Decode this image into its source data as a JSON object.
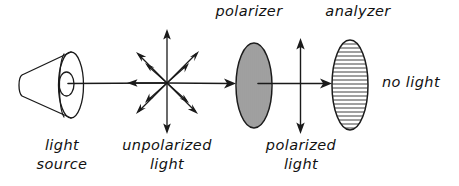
{
  "diagram": {
    "title_hidden": "",
    "background_color": "#ffffff",
    "ink_color": "#1a1a1a",
    "labels": {
      "polarizer": "polarizer",
      "analyzer": "analyzer",
      "light_source_line1": "light",
      "light_source_line2": "source",
      "unpolarized_line1": "unpolarized",
      "unpolarized_line2": "light",
      "polarized_line1": "polarized",
      "polarized_line2": "light",
      "no_light": "no light"
    },
    "elements": {
      "light_source_icon": "cone-lamp-icon",
      "unpolarized_star_icon": "radiating-arrows-icon",
      "polarizer_icon": "vertical-striped-ellipse-icon",
      "analyzer_icon": "horizontal-striped-ellipse-icon",
      "polarized_arrow_icon": "vertical-double-arrow-icon",
      "beam_arrow_icon": "right-arrow-icon"
    },
    "counts": {
      "star_arrow_count": 8,
      "polarizer_stripe_count": 17,
      "analyzer_stripe_count": 22
    }
  }
}
